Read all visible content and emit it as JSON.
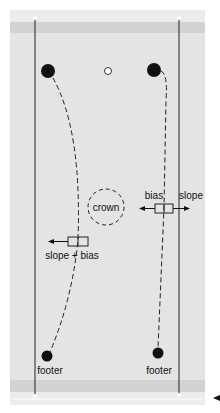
{
  "labels": {
    "crown": "crown",
    "bias": "bias",
    "slope": "slope",
    "slope_bias": "slope + bias",
    "footer_left": "footer",
    "footer_right": "footer"
  },
  "colors": {
    "panel": "#e4e4e4",
    "band": "#d0d0d0",
    "strip": "#ececec",
    "ink": "#111111"
  }
}
